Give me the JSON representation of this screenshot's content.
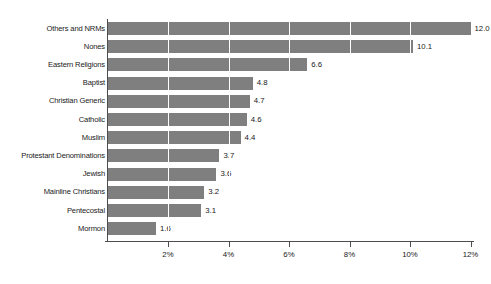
{
  "chart_data": {
    "type": "bar",
    "orientation": "horizontal",
    "title": "",
    "xlabel": "",
    "ylabel": "",
    "xlim": [
      0,
      12
    ],
    "grid": true,
    "grid_axis": "x",
    "legend": "none",
    "bar_color": "#7f7f7f",
    "axis_color": "#4d4d4d",
    "value_suffix": "",
    "tick_suffix": "%",
    "categories": [
      "Others and NRMs",
      "Nones",
      "Eastern Religions",
      "Baptist",
      "Christian Generic",
      "Catholic",
      "Muslim",
      "Protestant Denominations",
      "Jewish",
      "Mainline Christians",
      "Pentecostal",
      "Mormon"
    ],
    "values": [
      12.0,
      10.1,
      6.6,
      4.8,
      4.7,
      4.6,
      4.4,
      3.7,
      3.6,
      3.2,
      3.1,
      1.6
    ],
    "value_labels": [
      "12.0",
      "10.1",
      "6.6",
      "4.8",
      "4.7",
      "4.6",
      "4.4",
      "3.7",
      "3.6",
      "3.2",
      "3.1",
      "1.6"
    ],
    "xticks": [
      2,
      4,
      6,
      8,
      10,
      12
    ],
    "xtick_labels": [
      "2%",
      "4%",
      "6%",
      "8%",
      "10%",
      "12%"
    ]
  }
}
